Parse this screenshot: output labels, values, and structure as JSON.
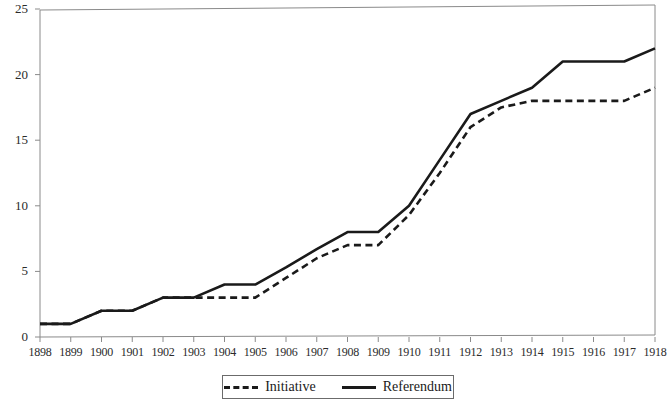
{
  "chart_data": {
    "type": "line",
    "title": "",
    "subtitle": "",
    "xlabel": "",
    "ylabel": "",
    "x": [
      1898,
      1899,
      1900,
      1901,
      1902,
      1903,
      1904,
      1905,
      1906,
      1907,
      1908,
      1909,
      1910,
      1911,
      1912,
      1913,
      1914,
      1915,
      1916,
      1917,
      1918
    ],
    "categories": [
      "1898",
      "1899",
      "1900",
      "1901",
      "1902",
      "1903",
      "1904",
      "1905",
      "1906",
      "1907",
      "1908",
      "1909",
      "1910",
      "1911",
      "1912",
      "1913",
      "1914",
      "1915",
      "1916",
      "1917",
      "1918"
    ],
    "series": [
      {
        "name": "Initiative",
        "style": "dashed",
        "color": "#1a1a1a",
        "values": [
          1,
          1,
          2,
          2,
          3,
          3,
          3,
          3,
          4.5,
          6,
          7,
          7,
          9.3,
          12.5,
          16,
          17.5,
          18,
          18,
          18,
          18,
          19
        ]
      },
      {
        "name": "Referendum",
        "style": "solid",
        "color": "#1a1a1a",
        "values": [
          1,
          1,
          2,
          2,
          3,
          3,
          4,
          4,
          5.3,
          6.7,
          8,
          8,
          10,
          13.5,
          17,
          18,
          19,
          21,
          21,
          21,
          22
        ]
      }
    ],
    "ylim": [
      0,
      25
    ],
    "yticks": [
      0,
      5,
      10,
      15,
      20,
      25
    ],
    "ytick_labels": [
      "0",
      "5",
      "10",
      "15",
      "20",
      "25"
    ],
    "xlim": [
      1898,
      1918
    ],
    "grid": false,
    "legend_position": "bottom-center",
    "legend": [
      {
        "label": "Initiative",
        "style": "dashed"
      },
      {
        "label": "Referendum",
        "style": "solid"
      }
    ]
  },
  "axes": {
    "frame_color": "#8a8a8a",
    "line_color": "#1a1a1a"
  }
}
